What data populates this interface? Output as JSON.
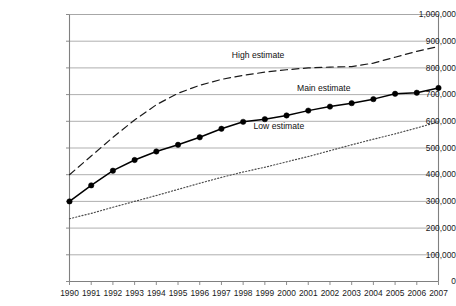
{
  "chart_data": {
    "type": "line",
    "title": "",
    "subtitle": "",
    "xlabel": "",
    "ylabel": "",
    "categories": [
      "1990",
      "1991",
      "1992",
      "1993",
      "1994",
      "1995",
      "1996",
      "1997",
      "1998",
      "1999",
      "2000",
      "2001",
      "2002",
      "2003",
      "2004",
      "2005",
      "2006",
      "2007"
    ],
    "x": [
      1990,
      1991,
      1992,
      1993,
      1994,
      1995,
      1996,
      1997,
      1998,
      1999,
      2000,
      2001,
      2002,
      2003,
      2004,
      2005,
      2006,
      2007
    ],
    "ylim": [
      0,
      1000000
    ],
    "xlim": [
      1990,
      2007
    ],
    "yticks": [
      0,
      100000,
      200000,
      300000,
      400000,
      500000,
      600000,
      700000,
      800000,
      900000,
      1000000
    ],
    "ytick_labels": [
      "0",
      "100,000",
      "200,000",
      "300,000",
      "400,000",
      "500,000",
      "600,000",
      "700,000",
      "800,000",
      "900,000",
      "1,000,000"
    ],
    "grid": "horizontal",
    "legend_position": "inline-annotations",
    "series": [
      {
        "name": "High estimate",
        "style": "dashed",
        "markers": false,
        "color": "#1a1a1a",
        "values": [
          400000,
          470000,
          540000,
          605000,
          662000,
          705000,
          735000,
          757000,
          772000,
          784000,
          793000,
          800000,
          803000,
          805000,
          818000,
          840000,
          862000,
          880000
        ]
      },
      {
        "name": "Main estimate",
        "style": "solid",
        "markers": true,
        "color": "#000000",
        "values": [
          300000,
          360000,
          415000,
          455000,
          487000,
          512000,
          540000,
          572000,
          598000,
          608000,
          622000,
          640000,
          655000,
          668000,
          683000,
          703000,
          707000,
          725000
        ]
      },
      {
        "name": "Low estimate",
        "style": "dotted",
        "markers": false,
        "color": "#4d4d4d",
        "values": [
          235000,
          255000,
          278000,
          300000,
          322000,
          345000,
          368000,
          390000,
          410000,
          428000,
          448000,
          468000,
          490000,
          512000,
          533000,
          553000,
          575000,
          598000
        ]
      }
    ],
    "annotations": [
      {
        "text": "High estimate",
        "x": 1999,
        "y": 845000
      },
      {
        "text": "Main estimate",
        "x": 2002,
        "y": 725000
      },
      {
        "text": "Low estimate",
        "x": 2000,
        "y": 580000
      }
    ]
  },
  "axis": {
    "y_labels": [
      "1,000,000",
      "900,000",
      "800,000",
      "700,000",
      "600,000",
      "500,000",
      "400,000",
      "300,000",
      "200,000",
      "100,000",
      "0"
    ],
    "x_labels": [
      "1990",
      "1991",
      "1992",
      "1993",
      "1994",
      "1995",
      "1996",
      "1997",
      "1998",
      "1999",
      "2000",
      "2001",
      "2002",
      "2003",
      "2004",
      "2005",
      "2006",
      "2007"
    ]
  },
  "colors": {
    "axis": "#808080",
    "grid": "#a6a6a6",
    "high": "#1a1a1a",
    "main": "#000000",
    "low": "#4d4d4d",
    "background": "#ffffff"
  }
}
